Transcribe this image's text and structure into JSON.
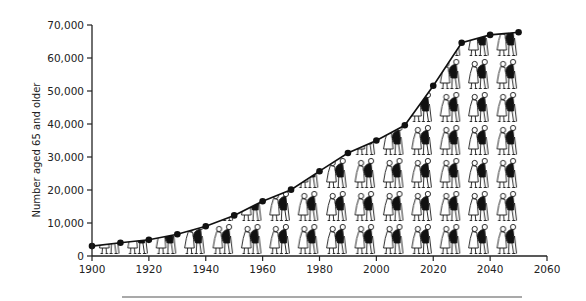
{
  "chart_data": {
    "type": "line",
    "title": "",
    "xlabel": "",
    "ylabel": "Number aged 65 and older",
    "x": [
      1900,
      1910,
      1920,
      1930,
      1940,
      1950,
      1960,
      1970,
      1980,
      1990,
      2000,
      2010,
      2020,
      2030,
      2040,
      2050
    ],
    "series": [
      {
        "name": "Number aged 65 and older",
        "values": [
          3000,
          4000,
          4900,
          6600,
          9000,
          12300,
          16600,
          20100,
          25700,
          31200,
          35000,
          39600,
          51600,
          64600,
          67000,
          67800
        ]
      }
    ],
    "xlim": [
      1900,
      2060
    ],
    "ylim": [
      0,
      70000
    ],
    "xticks": [
      "1900",
      "1920",
      "1940",
      "1960",
      "1980",
      "2000",
      "2020",
      "2040",
      "2060"
    ],
    "yticks": [
      "0",
      "10,000",
      "20,000",
      "30,000",
      "40,000",
      "50,000",
      "60,000",
      "70,000"
    ],
    "grid": false,
    "legend": "none",
    "fill": "pictogram of elderly couples walking with canes, filling area under curve",
    "colors": {
      "line": "#111111",
      "marker": "#111111",
      "axis": "#222222",
      "figure_dark": "#111111",
      "figure_light": "#ffffff"
    }
  },
  "axis": {
    "ylabel": "Number aged 65 and older"
  }
}
